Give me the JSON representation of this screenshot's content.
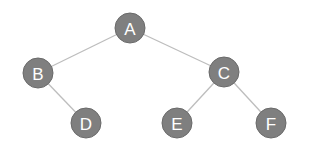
{
  "diagram": {
    "type": "binary-tree",
    "colors": {
      "node_fill": "#7f7f7f",
      "node_stroke": "#6a6a6a",
      "label": "#ffffff",
      "edge": "#bdbdbd",
      "background": "#ffffff"
    },
    "nodes": [
      {
        "id": "A",
        "label": "A",
        "x": 130,
        "y": 28
      },
      {
        "id": "B",
        "label": "B",
        "x": 38,
        "y": 73
      },
      {
        "id": "C",
        "label": "C",
        "x": 224,
        "y": 72
      },
      {
        "id": "D",
        "label": "D",
        "x": 86,
        "y": 123
      },
      {
        "id": "E",
        "label": "E",
        "x": 177,
        "y": 123
      },
      {
        "id": "F",
        "label": "F",
        "x": 271,
        "y": 123
      }
    ],
    "edges": [
      {
        "from": "A",
        "to": "B"
      },
      {
        "from": "A",
        "to": "C"
      },
      {
        "from": "B",
        "to": "D"
      },
      {
        "from": "C",
        "to": "E"
      },
      {
        "from": "C",
        "to": "F"
      }
    ]
  }
}
